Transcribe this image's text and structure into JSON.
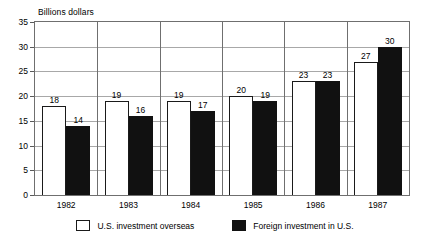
{
  "chart_data": {
    "type": "bar",
    "title": "Billions dollars",
    "xlabel": "",
    "ylabel": "Billions dollars",
    "ylim": [
      0,
      35
    ],
    "yticks": [
      0,
      5,
      10,
      15,
      20,
      25,
      30,
      35
    ],
    "grid": true,
    "legend_position": "bottom",
    "categories": [
      "1982",
      "1983",
      "1984",
      "1985",
      "1986",
      "1987"
    ],
    "series": [
      {
        "name": "U.S. investment overseas",
        "style": "light",
        "values": [
          18,
          19,
          19,
          20,
          23,
          27
        ]
      },
      {
        "name": "Foreign investment in U.S.",
        "style": "dark",
        "values": [
          14,
          16,
          17,
          19,
          23,
          30
        ]
      }
    ]
  },
  "axis": {
    "title": "Billions dollars",
    "tick_labels": [
      "35",
      "30",
      "25",
      "20",
      "15",
      "10",
      "5",
      "0"
    ],
    "category_labels": [
      "1982",
      "1983",
      "1984",
      "1985",
      "1986",
      "1987"
    ]
  },
  "value_labels": {
    "light": [
      "18",
      "19",
      "19",
      "20",
      "23",
      "27"
    ],
    "dark": [
      "14",
      "16",
      "17",
      "19",
      "23",
      "30"
    ]
  },
  "legend": {
    "items": [
      {
        "label": "U.S. investment overseas",
        "swatch": "white-square-outline"
      },
      {
        "label": "Foreign investment in U.S.",
        "swatch": "black-square-filled"
      }
    ]
  },
  "colors": {
    "light_bar": "#ffffff",
    "dark_bar": "#111111",
    "bar_outline": "#1a1a1a",
    "grid": "#a8a8a8",
    "frame": "#6f6f6f",
    "text": "#000000",
    "background": "#ffffff"
  }
}
